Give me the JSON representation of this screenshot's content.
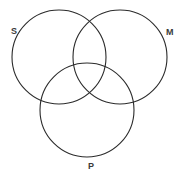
{
  "diagram": {
    "type": "venn-three-circle",
    "canvas": {
      "width": 183,
      "height": 178,
      "background": "#ffffff"
    },
    "stroke_color": "#2b2b2b",
    "stroke_width": 1.1,
    "label_color": "#3a3a3a",
    "circles": [
      {
        "id": "S",
        "label": "S",
        "cx": 59,
        "cy": 57,
        "r": 47,
        "label_x": 11,
        "label_y": 27
      },
      {
        "id": "M",
        "label": "M",
        "cx": 120,
        "cy": 57,
        "r": 47,
        "label_x": 166,
        "label_y": 28
      },
      {
        "id": "P",
        "label": "P",
        "cx": 87,
        "cy": 110,
        "r": 47,
        "label_x": 88,
        "label_y": 162
      }
    ],
    "labels": {
      "s": "S",
      "m": "M",
      "p": "P"
    }
  }
}
